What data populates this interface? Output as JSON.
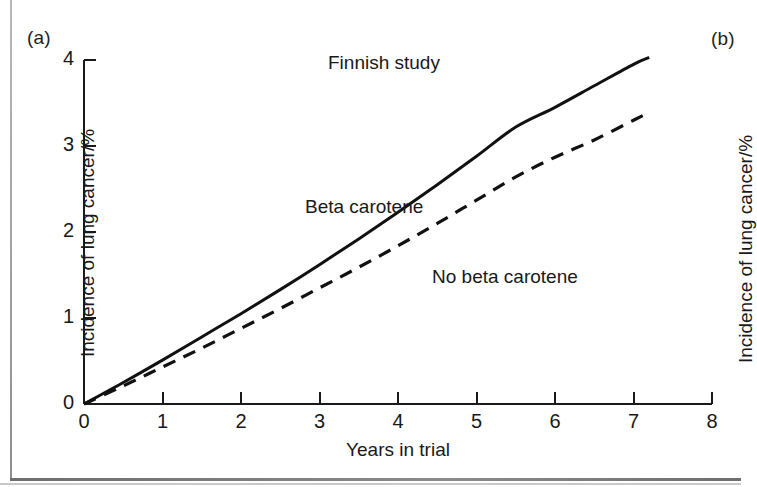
{
  "figure": {
    "panel_a_letter": "(a)",
    "panel_b_letter": "(b)"
  },
  "panel_b": {
    "ylabel_partial": "Incidence of lung cancer/%"
  },
  "chart_data": {
    "type": "line",
    "title": "Finnish study",
    "xlabel": "Years in trial",
    "ylabel": "Incidence of lung cancer/%",
    "xlim": [
      0,
      8
    ],
    "ylim": [
      0,
      4
    ],
    "xticks": [
      0,
      1,
      2,
      3,
      4,
      5,
      6,
      7,
      8
    ],
    "xtick_labels": [
      "0",
      "1",
      "2",
      "3",
      "4",
      "5",
      "6",
      "7",
      "8"
    ],
    "yticks": [
      0,
      1,
      2,
      3,
      4
    ],
    "ytick_labels": [
      "0",
      "1",
      "2",
      "3",
      "4"
    ],
    "grid": false,
    "legend_position": "inline-annotation",
    "series": [
      {
        "name": "Beta carotene",
        "style": "solid",
        "color": "#111111",
        "x": [
          0.0,
          0.5,
          1.0,
          1.5,
          2.0,
          2.5,
          3.0,
          3.5,
          4.0,
          4.5,
          5.0,
          5.5,
          6.0,
          6.5,
          7.0,
          7.2
        ],
        "y": [
          0.0,
          0.25,
          0.51,
          0.78,
          1.05,
          1.33,
          1.62,
          1.92,
          2.23,
          2.55,
          2.88,
          3.22,
          3.45,
          3.7,
          3.95,
          4.03
        ]
      },
      {
        "name": "No beta carotene",
        "style": "dashed",
        "color": "#111111",
        "x": [
          0.0,
          0.5,
          1.0,
          1.5,
          2.0,
          2.5,
          3.0,
          3.5,
          4.0,
          4.5,
          5.0,
          5.5,
          6.0,
          6.5,
          7.0,
          7.2
        ],
        "y": [
          0.0,
          0.21,
          0.43,
          0.65,
          0.88,
          1.11,
          1.35,
          1.59,
          1.84,
          2.1,
          2.37,
          2.64,
          2.87,
          3.07,
          3.3,
          3.39
        ]
      }
    ],
    "annotations": [
      {
        "text": "Finnish study",
        "x": 3.1,
        "y": 3.85
      },
      {
        "text": "Beta carotene",
        "x": 2.8,
        "y": 2.2
      },
      {
        "text": "No beta carotene",
        "x": 4.4,
        "y": 1.4
      }
    ]
  }
}
